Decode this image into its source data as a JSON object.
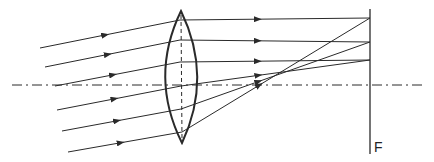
{
  "diagram": {
    "title": "",
    "type": "ray-optics",
    "focal_plane_label": "F",
    "colors": {
      "stroke": "#2a2a2a",
      "background": "#ffffff"
    },
    "optical_axis": {
      "y": 85,
      "x_start": 12,
      "x_end": 424,
      "style": "dash-dot"
    },
    "lens": {
      "center_x": 181,
      "top_y": 11,
      "bottom_y": 143,
      "half_width": 16,
      "axis_style": "dashed"
    },
    "focal_plane": {
      "x": 370,
      "y_top": 9,
      "y_bottom": 154
    },
    "rays": [
      {
        "start": [
          40,
          48
        ],
        "lens": [
          180,
          20
        ],
        "end": [
          370,
          18
        ]
      },
      {
        "start": [
          45,
          67
        ],
        "lens": [
          180,
          40
        ],
        "end": [
          370,
          42
        ]
      },
      {
        "start": [
          55,
          86
        ],
        "lens": [
          180,
          62
        ],
        "end": [
          370,
          60
        ]
      },
      {
        "start": [
          57,
          110
        ],
        "lens": [
          181,
          86
        ],
        "end": [
          370,
          60
        ]
      },
      {
        "start": [
          62,
          131
        ],
        "lens": [
          181,
          109
        ],
        "end": [
          370,
          42
        ]
      },
      {
        "start": [
          68,
          152
        ],
        "lens": [
          182,
          132
        ],
        "end": [
          370,
          18
        ]
      }
    ]
  }
}
